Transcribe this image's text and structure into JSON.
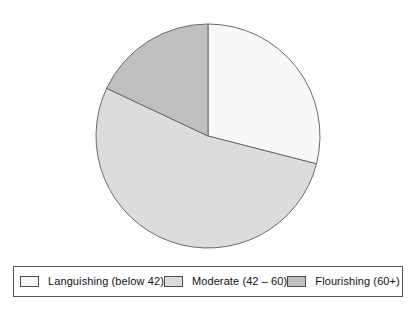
{
  "chart_data": {
    "type": "pie",
    "title": "",
    "subtitle": "",
    "xlabel": "",
    "ylabel": "",
    "legend_position": "bottom",
    "grid": false,
    "start_angle_deg": 90,
    "direction": "clockwise",
    "categories": [
      "Languishing (below 42)",
      "Moderate (42 – 60)",
      "Flourishing (60+)"
    ],
    "values": [
      29,
      53,
      18
    ],
    "units": "percent",
    "slices": [
      {
        "label": "Languishing (below 42)",
        "value": 29,
        "color": "#f8f8f8",
        "start_deg": 0,
        "end_deg": 104.4
      },
      {
        "label": "Moderate (42 – 60)",
        "value": 53,
        "color": "#dcdcdc",
        "start_deg": 104.4,
        "end_deg": 295.2
      },
      {
        "label": "Flourishing (60+)",
        "value": 18,
        "color": "#bfbfbf",
        "start_deg": 295.2,
        "end_deg": 360
      }
    ],
    "edge_color": "#6b6b6b",
    "background": "#ffffff"
  },
  "legend": {
    "items": [
      {
        "label": "Languishing (below 42)",
        "color": "#f8f8f8"
      },
      {
        "label": "Moderate (42 – 60)",
        "color": "#dcdcdc"
      },
      {
        "label": "Flourishing (60+)",
        "color": "#bfbfbf"
      }
    ]
  }
}
